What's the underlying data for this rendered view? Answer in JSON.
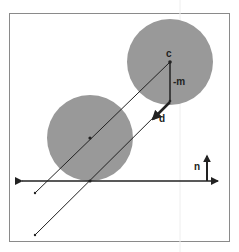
{
  "diagram": {
    "labels": {
      "center": "c",
      "neg_m": "-m",
      "direction": "d",
      "normal": "n"
    },
    "colors": {
      "background": "#ffffff",
      "frame": "#8a8a8a",
      "circle_fill": "#999999",
      "line": "#222222"
    },
    "shapes": {
      "circle_upper": {
        "cx": 170,
        "cy": 62,
        "r": 43
      },
      "circle_lower": {
        "cx": 90,
        "cy": 138,
        "r": 43
      },
      "plane_y": 181
    }
  }
}
